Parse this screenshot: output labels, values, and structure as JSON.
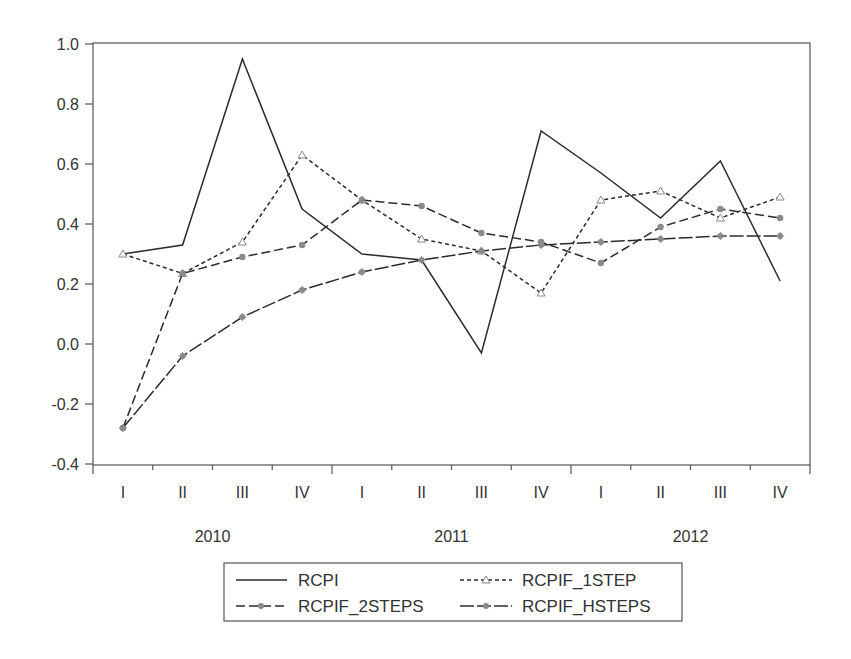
{
  "chart_data": {
    "type": "line",
    "title": "",
    "xlabel": "",
    "ylabel": "",
    "ylim": [
      -0.4,
      1.0
    ],
    "yticks": [
      "1.0",
      "0.8",
      "0.6",
      "0.4",
      "0.2",
      "0.0",
      "-0.2",
      "-0.4"
    ],
    "ytick_values": [
      1.0,
      0.8,
      0.6,
      0.4,
      0.2,
      0.0,
      -0.2,
      -0.4
    ],
    "categories": [
      "I",
      "II",
      "III",
      "IV",
      "I",
      "II",
      "III",
      "IV",
      "I",
      "II",
      "III",
      "IV"
    ],
    "year_labels": [
      {
        "label": "2010",
        "center_index": 1.5
      },
      {
        "label": "2011",
        "center_index": 5.5
      },
      {
        "label": "2012",
        "center_index": 9.5
      }
    ],
    "grid": false,
    "legend_position": "bottom-center",
    "series": [
      {
        "name": "RCPI",
        "style": "solid",
        "marker": "none",
        "values": [
          0.3,
          0.33,
          0.95,
          0.45,
          0.3,
          0.28,
          -0.03,
          0.71,
          0.57,
          0.42,
          0.61,
          0.21
        ]
      },
      {
        "name": "RCPIF_1STEP",
        "style": "short-dash",
        "marker": "triangle-open",
        "values": [
          0.3,
          0.235,
          0.34,
          0.63,
          0.48,
          0.35,
          0.31,
          0.17,
          0.48,
          0.51,
          0.42,
          0.49
        ]
      },
      {
        "name": "RCPIF_2STEPS",
        "style": "long-dash",
        "marker": "circle-filled",
        "values": [
          -0.28,
          0.235,
          0.29,
          0.33,
          0.48,
          0.46,
          0.37,
          0.34,
          0.27,
          0.39,
          0.45,
          0.42
        ]
      },
      {
        "name": "RCPIF_HSTEPS",
        "style": "long-dash-dot",
        "marker": "star-filled",
        "values": [
          -0.28,
          -0.04,
          0.09,
          0.18,
          0.24,
          0.28,
          0.31,
          0.33,
          0.34,
          0.35,
          0.36,
          0.36
        ]
      }
    ]
  },
  "legend": {
    "items": [
      {
        "label": "RCPI"
      },
      {
        "label": "RCPIF_1STEP"
      },
      {
        "label": "RCPIF_2STEPS"
      },
      {
        "label": "RCPIF_HSTEPS"
      }
    ]
  },
  "colors": {
    "line": "#2b2b2b",
    "marker": "#8a8a8a",
    "axis": "#444444",
    "background": "#ffffff"
  }
}
